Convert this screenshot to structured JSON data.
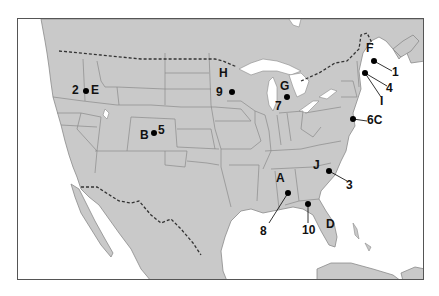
{
  "map": {
    "title": "",
    "land_color": "#c9c9c9",
    "water_color": "#ffffff",
    "boundary_color": "#8a8a8a",
    "border_style": "dashed",
    "markers": [
      {
        "id": "m-2E",
        "dot": [
          85,
          90
        ],
        "labels": [
          {
            "text": "2",
            "x": 72,
            "y": 84
          },
          {
            "text": "E",
            "x": 91,
            "y": 84
          }
        ]
      },
      {
        "id": "m-B5",
        "dot": [
          153,
          132
        ],
        "labels": [
          {
            "text": "B",
            "x": 140,
            "y": 129
          },
          {
            "text": "5",
            "x": 158,
            "y": 124
          }
        ]
      },
      {
        "id": "m-H9",
        "dot": [
          231,
          91
        ],
        "labels": [
          {
            "text": "H",
            "x": 219,
            "y": 67
          },
          {
            "text": "9",
            "x": 216,
            "y": 86
          }
        ]
      },
      {
        "id": "m-G7",
        "dot": [
          286,
          96
        ],
        "labels": [
          {
            "text": "G",
            "x": 280,
            "y": 80
          },
          {
            "text": "7",
            "x": 275,
            "y": 100
          }
        ]
      },
      {
        "id": "m-F1",
        "dot": [
          373,
          60
        ],
        "leader_to": [
          391,
          70
        ],
        "labels": [
          {
            "text": "F",
            "x": 366,
            "y": 42
          },
          {
            "text": "1",
            "x": 392,
            "y": 66
          }
        ]
      },
      {
        "id": "m-4I",
        "dot": [
          364,
          72
        ],
        "leader_to": [
          386,
          85
        ],
        "leader2_to": [
          380,
          97
        ],
        "labels": [
          {
            "text": "4",
            "x": 386,
            "y": 82
          },
          {
            "text": "I",
            "x": 380,
            "y": 95
          }
        ]
      },
      {
        "id": "m-6C",
        "dot": [
          352,
          118
        ],
        "leader_to": [
          366,
          120
        ],
        "labels": [
          {
            "text": "6C",
            "x": 367,
            "y": 114
          }
        ]
      },
      {
        "id": "m-J3",
        "dot": [
          328,
          170
        ],
        "leader_to": [
          346,
          180
        ],
        "labels": [
          {
            "text": "J",
            "x": 313,
            "y": 159
          },
          {
            "text": "3",
            "x": 346,
            "y": 179
          }
        ]
      },
      {
        "id": "m-A8",
        "dot": [
          287,
          192
        ],
        "leader_to": [
          268,
          222
        ],
        "labels": [
          {
            "text": "A",
            "x": 276,
            "y": 172
          },
          {
            "text": "8",
            "x": 260,
            "y": 225
          }
        ]
      },
      {
        "id": "m-10",
        "dot": [
          307,
          203
        ],
        "leader_to": [
          307,
          222
        ],
        "labels": [
          {
            "text": "10",
            "x": 302,
            "y": 224
          }
        ]
      },
      {
        "id": "m-D",
        "dot": null,
        "labels": [
          {
            "text": "D",
            "x": 326,
            "y": 218
          }
        ]
      }
    ]
  }
}
